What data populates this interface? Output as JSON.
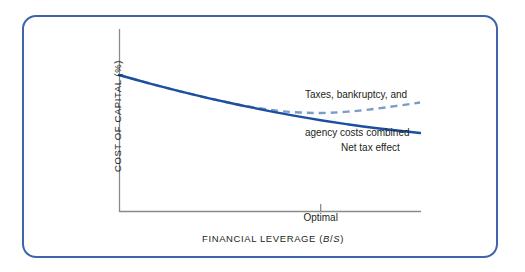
{
  "figure": {
    "frame_color": "#3f63ad",
    "background": "#ffffff"
  },
  "chart_data": {
    "type": "line",
    "title": "",
    "subtitle": "",
    "xlabel_prefix": "FINANCIAL LEVERAGE (",
    "xlabel_italic_1": "B",
    "xlabel_slash": "/",
    "xlabel_italic_2": "S",
    "xlabel_suffix": ")",
    "xlabel": "FINANCIAL LEVERAGE (B/S)",
    "ylabel": "COST OF CAPITAL (%)",
    "grid": false,
    "legend_position": "inline-annotations",
    "axis_color": "#808080",
    "x_tick_labels": [
      "Optimal"
    ],
    "x_tick_positions": [
      0.67
    ],
    "y_tick_labels": [],
    "xlim": [
      0,
      1
    ],
    "ylim": [
      0,
      1
    ],
    "series": [
      {
        "name": "Net tax effect",
        "style": "solid",
        "color": "#1c4fa0",
        "width": 2.4,
        "annotation": "Net tax effect",
        "x": [
          0.0,
          0.1,
          0.2,
          0.3,
          0.4,
          0.5,
          0.6,
          0.67,
          0.75,
          0.85,
          1.0
        ],
        "y": [
          1.0,
          0.925,
          0.855,
          0.79,
          0.73,
          0.675,
          0.625,
          0.593,
          0.56,
          0.523,
          0.478
        ]
      },
      {
        "name": "Taxes, bankruptcy, and agency costs combined",
        "style": "dashed",
        "color": "#7a9cc8",
        "width": 2.4,
        "dash": "7 5",
        "annotation_line_1": "Taxes, bankruptcy, and",
        "annotation_line_2": "agency costs combined",
        "x": [
          0.0,
          0.1,
          0.2,
          0.3,
          0.42,
          0.52,
          0.6,
          0.67,
          0.75,
          0.85,
          1.0
        ],
        "y": [
          1.0,
          0.925,
          0.855,
          0.79,
          0.722,
          0.68,
          0.663,
          0.658,
          0.668,
          0.695,
          0.752
        ]
      }
    ]
  },
  "labels": {
    "y_axis_title": "COST OF CAPITAL (%)",
    "x_axis_title_prefix": "FINANCIAL LEVERAGE (",
    "x_axis_title_b": "B",
    "x_axis_title_slash": "/",
    "x_axis_title_s": "S",
    "x_axis_title_suffix": ")",
    "optimal": "Optimal",
    "combined_line1": "Taxes, bankruptcy, and",
    "combined_line2": "agency costs combined",
    "net_tax_effect": "Net tax effect"
  }
}
